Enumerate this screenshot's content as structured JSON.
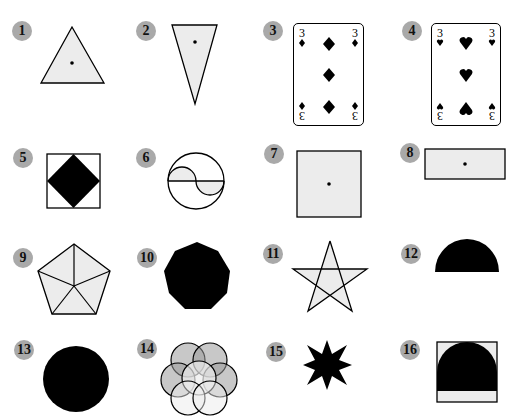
{
  "colors": {
    "fill_light": "#ececec",
    "fill_dark": "#000000",
    "stroke": "#000000",
    "badge": "#a9a9a9",
    "petal_dark": "#9a9a9a"
  },
  "figures": [
    {
      "number": "1",
      "shape": "equilateral-triangle",
      "has_center_dot": true
    },
    {
      "number": "2",
      "shape": "inverted-isosceles-triangle",
      "has_center_dot": true
    },
    {
      "number": "3",
      "shape": "playing-card",
      "rank": "3",
      "suit": "diamonds"
    },
    {
      "number": "4",
      "shape": "playing-card",
      "rank": "3",
      "suit": "hearts"
    },
    {
      "number": "5",
      "shape": "square-with-inscribed-black-diamond"
    },
    {
      "number": "6",
      "shape": "circle-with-s-curve"
    },
    {
      "number": "7",
      "shape": "square",
      "has_center_dot": true
    },
    {
      "number": "8",
      "shape": "rectangle",
      "has_center_dot": true
    },
    {
      "number": "9",
      "shape": "pentagon-divided-into-5-triangles"
    },
    {
      "number": "10",
      "shape": "black-octagon"
    },
    {
      "number": "11",
      "shape": "five-pointed-star"
    },
    {
      "number": "12",
      "shape": "black-semicircle"
    },
    {
      "number": "13",
      "shape": "black-circle"
    },
    {
      "number": "14",
      "shape": "overlapping-circles-rosette"
    },
    {
      "number": "15",
      "shape": "eight-pointed-black-star"
    },
    {
      "number": "16",
      "shape": "square-with-black-arch"
    }
  ],
  "card_labels": {
    "rank": "3",
    "rank_flipped": "3"
  }
}
